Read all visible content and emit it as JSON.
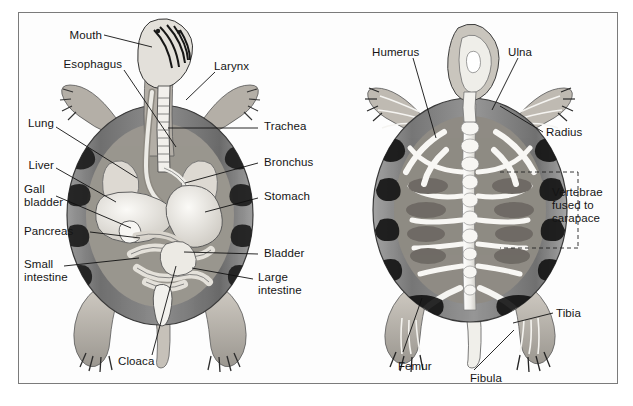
{
  "figure": {
    "background_color": "#ffffff",
    "frame_color": "#7b7b7b",
    "text_color": "#151515",
    "style": "grayscale halftone textbook illustration"
  },
  "panels": [
    {
      "id": "organs",
      "name": "Internal organs (ventral view)",
      "labels": [
        {
          "key": "mouth",
          "text": "Mouth"
        },
        {
          "key": "esophagus",
          "text": "Esophagus"
        },
        {
          "key": "larynx",
          "text": "Larynx"
        },
        {
          "key": "lung",
          "text": "Lung"
        },
        {
          "key": "trachea",
          "text": "Trachea"
        },
        {
          "key": "liver",
          "text": "Liver"
        },
        {
          "key": "bronchus",
          "text": "Bronchus"
        },
        {
          "key": "gall_bladder",
          "text": "Gall\nbladder"
        },
        {
          "key": "stomach",
          "text": "Stomach"
        },
        {
          "key": "pancreas",
          "text": "Pancreas"
        },
        {
          "key": "bladder",
          "text": "Bladder"
        },
        {
          "key": "small_intestine",
          "text": "Small\nintestine"
        },
        {
          "key": "large_intestine",
          "text": "Large\nintestine"
        },
        {
          "key": "cloaca",
          "text": "Cloaca"
        }
      ]
    },
    {
      "id": "skeleton",
      "name": "Skeleton (dorsal view)",
      "labels": [
        {
          "key": "humerus",
          "text": "Humerus"
        },
        {
          "key": "ulna",
          "text": "Ulna"
        },
        {
          "key": "radius",
          "text": "Radius"
        },
        {
          "key": "vertebrae",
          "text": "Vertebrae\nfused to\ncarapace"
        },
        {
          "key": "tibia",
          "text": "Tibia"
        },
        {
          "key": "femur",
          "text": "Femur"
        },
        {
          "key": "fibula",
          "text": "Fibula"
        }
      ]
    }
  ],
  "palette": {
    "shell_dark": "#4f4f4f",
    "shell_mid": "#8d8d8d",
    "shell_light": "#bdbdbd",
    "flesh": "#b9b3ab",
    "organ_light": "#e7e4de",
    "bone_white": "#f6f5f2",
    "outline": "#2a2a2a"
  }
}
